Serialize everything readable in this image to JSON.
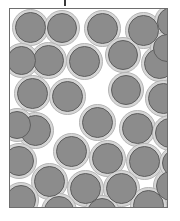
{
  "figure": {
    "canvas": {
      "width": 180,
      "height": 221
    },
    "background_color": "#ffffff"
  },
  "top_tick": {
    "name": "tick-mark",
    "x": 64,
    "y": 0,
    "width": 2,
    "height": 6,
    "color": "#3a3a3a"
  },
  "frame": {
    "name": "sample-boundary",
    "x": 9,
    "y": 8,
    "width": 159,
    "height": 200,
    "border_color": "#6e6e6e",
    "border_width": 1,
    "fill_color": "#ffffff"
  },
  "particle_style": {
    "core_color": "#8c8c8c",
    "core_outline_color": "#5e5e5e",
    "core_outline_width": 1.3,
    "halo_color": "#d6d6d6",
    "halo_outline_color": "#b4b4b4",
    "halo_outline_width": 1,
    "core_diameter": 30,
    "halo_diameter": 36
  },
  "particles": [
    {
      "id": 1,
      "cx": 21,
      "cy": 19,
      "r_core": 15.5,
      "r_halo": 18.5
    },
    {
      "id": 2,
      "cx": 53,
      "cy": 20,
      "r_core": 15.0,
      "r_halo": 18.0
    },
    {
      "id": 3,
      "cx": 93,
      "cy": 20,
      "r_core": 15.5,
      "r_halo": 18.5
    },
    {
      "id": 4,
      "cx": 134,
      "cy": 22,
      "r_core": 15.5,
      "r_halo": 18.5
    },
    {
      "id": 5,
      "cx": 163,
      "cy": 14,
      "r_core": 15.0,
      "r_halo": 18.0
    },
    {
      "id": 6,
      "cx": 39,
      "cy": 52,
      "r_core": 15.5,
      "r_halo": 18.5
    },
    {
      "id": 7,
      "cx": 75,
      "cy": 53,
      "r_core": 15.5,
      "r_halo": 18.5
    },
    {
      "id": 8,
      "cx": 114,
      "cy": 47,
      "r_core": 15.0,
      "r_halo": 18.0
    },
    {
      "id": 9,
      "cx": 150,
      "cy": 55,
      "r_core": 15.5,
      "r_halo": 18.5
    },
    {
      "id": 10,
      "cx": 12,
      "cy": 52,
      "r_core": 14.5,
      "r_halo": 17.5
    },
    {
      "id": 11,
      "cx": 23,
      "cy": 85,
      "r_core": 15.5,
      "r_halo": 18.5
    },
    {
      "id": 12,
      "cx": 58,
      "cy": 88,
      "r_core": 15.5,
      "r_halo": 18.5
    },
    {
      "id": 13,
      "cx": 117,
      "cy": 82,
      "r_core": 15.0,
      "r_halo": 18.0
    },
    {
      "id": 14,
      "cx": 154,
      "cy": 90,
      "r_core": 15.5,
      "r_halo": 18.5
    },
    {
      "id": 15,
      "cx": 88,
      "cy": 114,
      "r_core": 15.5,
      "r_halo": 18.5
    },
    {
      "id": 16,
      "cx": 26,
      "cy": 122,
      "r_core": 15.5,
      "r_halo": 18.5
    },
    {
      "id": 17,
      "cx": 128,
      "cy": 120,
      "r_core": 15.5,
      "r_halo": 18.5
    },
    {
      "id": 18,
      "cx": 161,
      "cy": 125,
      "r_core": 15.0,
      "r_halo": 18.0
    },
    {
      "id": 19,
      "cx": 10,
      "cy": 153,
      "r_core": 15.0,
      "r_halo": 18.0
    },
    {
      "id": 20,
      "cx": 62,
      "cy": 143,
      "r_core": 15.5,
      "r_halo": 18.5
    },
    {
      "id": 21,
      "cx": 98,
      "cy": 150,
      "r_core": 15.5,
      "r_halo": 18.5
    },
    {
      "id": 22,
      "cx": 135,
      "cy": 153,
      "r_core": 15.5,
      "r_halo": 18.5
    },
    {
      "id": 23,
      "cx": 40,
      "cy": 173,
      "r_core": 15.5,
      "r_halo": 18.5
    },
    {
      "id": 24,
      "cx": 76,
      "cy": 180,
      "r_core": 15.5,
      "r_halo": 18.5
    },
    {
      "id": 25,
      "cx": 112,
      "cy": 180,
      "r_core": 15.5,
      "r_halo": 18.5
    },
    {
      "id": 26,
      "cx": 162,
      "cy": 178,
      "r_core": 15.0,
      "r_halo": 18.0
    },
    {
      "id": 27,
      "cx": 12,
      "cy": 192,
      "r_core": 15.0,
      "r_halo": 18.0
    },
    {
      "id": 28,
      "cx": 50,
      "cy": 203,
      "r_core": 15.0,
      "r_halo": 18.0
    },
    {
      "id": 29,
      "cx": 93,
      "cy": 205,
      "r_core": 15.0,
      "r_halo": 18.0
    },
    {
      "id": 30,
      "cx": 139,
      "cy": 197,
      "r_core": 15.5,
      "r_halo": 18.5
    },
    {
      "id": 31,
      "cx": 167,
      "cy": 155,
      "r_core": 14.0,
      "r_halo": 17.0
    },
    {
      "id": 32,
      "cx": 8,
      "cy": 117,
      "r_core": 14.0,
      "r_halo": 17.0
    },
    {
      "id": 33,
      "cx": 158,
      "cy": 40,
      "r_core": 14.0,
      "r_halo": 17.0
    }
  ]
}
